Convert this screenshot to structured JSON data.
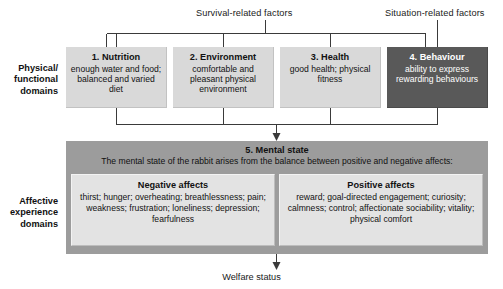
{
  "diagram": {
    "top_labels": {
      "survival": "Survival-related factors",
      "situation": "Situation-related factors"
    },
    "side_labels": {
      "physical": "Physical/\nfunctional\ndomains",
      "physical_lines": [
        "Physical/",
        "functional",
        "domains"
      ],
      "affective_lines": [
        "Affective",
        "experience",
        "domains"
      ]
    },
    "domains": [
      {
        "title": "1. Nutrition",
        "body": "enough water and food; balanced and varied diet",
        "style": "light",
        "fill": "#d9d9d9",
        "text_color": "#121212"
      },
      {
        "title": "2. Environment",
        "body": "comfortable and pleasant physical environment",
        "style": "light",
        "fill": "#d9d9d9",
        "text_color": "#121212"
      },
      {
        "title": "3. Health",
        "body": "good health; physical fitness",
        "style": "light",
        "fill": "#d9d9d9",
        "text_color": "#121212"
      },
      {
        "title": "4. Behaviour",
        "body": "ability to express rewarding behaviours",
        "style": "dark",
        "fill": "#595959",
        "text_color": "#ffffff"
      }
    ],
    "mental_state": {
      "title": "5. Mental state",
      "subtitle": "The mental state of the rabbit arises from the balance between positive and negative affects:",
      "panel_fill": "#9c9c9c",
      "affects": [
        {
          "title": "Negative affects",
          "body": "thirst; hunger; overheating; breathlessness; pain; weakness; frustration; loneliness; depression; fearfulness",
          "fill": "#e3e3e3"
        },
        {
          "title": "Positive affects",
          "body": "reward; goal-directed engagement; curiosity; calmness; control; affectionate sociability; vitality; physical comfort",
          "fill": "#e3e3e3"
        }
      ]
    },
    "outcome": {
      "label": "Welfare status"
    },
    "colors": {
      "line": "#3a3a3a",
      "background": "#ffffff"
    }
  }
}
